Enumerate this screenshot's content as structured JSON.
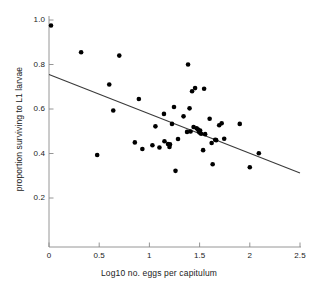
{
  "chart_data": {
    "type": "scatter",
    "title": "",
    "subtitle": "",
    "xlabel": "Log10 no. eggs per capitulum",
    "ylabel": "proportion surviving to L1 larvae",
    "xlim": [
      0,
      2.5
    ],
    "ylim": [
      0,
      1.02
    ],
    "xticks": [
      0,
      0.5,
      1,
      1.5,
      2,
      2.5
    ],
    "xtick_labels": [
      "0",
      "0.5",
      "1",
      "1.5",
      "2",
      "2.5"
    ],
    "yticks": [
      0.2,
      0.4,
      0.6,
      0.8,
      1.0
    ],
    "ytick_labels": [
      "0.2",
      "0.4",
      "0.6",
      "0.8",
      "1.0"
    ],
    "grid": false,
    "legend": null,
    "marker": {
      "shape": "circle",
      "color": "#000000",
      "size": 4.6
    },
    "series": [
      {
        "name": "observations",
        "points": [
          [
            0.02,
            0.975
          ],
          [
            0.32,
            0.855
          ],
          [
            0.48,
            0.393
          ],
          [
            0.6,
            0.71
          ],
          [
            0.64,
            0.593
          ],
          [
            0.7,
            0.84
          ],
          [
            0.855,
            0.45
          ],
          [
            0.895,
            0.645
          ],
          [
            0.93,
            0.42
          ],
          [
            1.03,
            0.437
          ],
          [
            1.06,
            0.522
          ],
          [
            1.1,
            0.427
          ],
          [
            1.145,
            0.578
          ],
          [
            1.15,
            0.455
          ],
          [
            1.185,
            0.443
          ],
          [
            1.2,
            0.429
          ],
          [
            1.205,
            0.441
          ],
          [
            1.225,
            0.533
          ],
          [
            1.245,
            0.609
          ],
          [
            1.26,
            0.322
          ],
          [
            1.285,
            0.465
          ],
          [
            1.34,
            0.567
          ],
          [
            1.375,
            0.497
          ],
          [
            1.385,
            0.8
          ],
          [
            1.4,
            0.603
          ],
          [
            1.41,
            0.499
          ],
          [
            1.425,
            0.68
          ],
          [
            1.44,
            0.519
          ],
          [
            1.455,
            0.694
          ],
          [
            1.47,
            0.513
          ],
          [
            1.485,
            0.508
          ],
          [
            1.495,
            0.499
          ],
          [
            1.5,
            0.494
          ],
          [
            1.505,
            0.503
          ],
          [
            1.515,
            0.489
          ],
          [
            1.535,
            0.415
          ],
          [
            1.545,
            0.691
          ],
          [
            1.555,
            0.487
          ],
          [
            1.6,
            0.556
          ],
          [
            1.62,
            0.447
          ],
          [
            1.63,
            0.352
          ],
          [
            1.655,
            0.462
          ],
          [
            1.665,
            0.46
          ],
          [
            1.695,
            0.527
          ],
          [
            1.72,
            0.536
          ],
          [
            1.745,
            0.466
          ],
          [
            1.9,
            0.533
          ],
          [
            2.0,
            0.338
          ],
          [
            2.09,
            0.401
          ]
        ]
      }
    ],
    "fit_line": {
      "name": "least-squares regression",
      "x_start": 0.0,
      "y_start": 0.755,
      "x_end": 2.5,
      "y_end": 0.312,
      "color": "#3a3a3a",
      "width": 1.1
    }
  }
}
